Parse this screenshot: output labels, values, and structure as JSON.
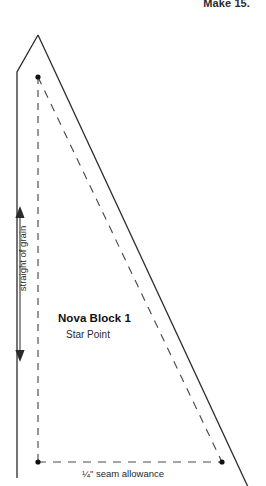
{
  "document": {
    "type": "quilting-pattern-template",
    "make_label": "Make 15.",
    "block_title": "Nova Block 1",
    "block_subtitle": "Star Point",
    "seam_allowance_label": "¼\" seam allowance",
    "grain_label": "straight of grain"
  },
  "colors": {
    "background": "#ffffff",
    "cut_line": "#2b2b2b",
    "stitch_line": "#555555",
    "dot": "#111111",
    "text": "#1a1a1a"
  },
  "geometry": {
    "cut_line": {
      "name": "cutting-line",
      "style": "solid",
      "points": [
        [
          38,
          35
        ],
        [
          17,
          72
        ],
        [
          17,
          478
        ],
        [
          247,
          486
        ]
      ],
      "note": "outer solid triangle outline, extends past bottom corners"
    },
    "stitch_line": {
      "name": "stitching-line",
      "style": "dashed",
      "points": [
        [
          38,
          77
        ],
        [
          38,
          462
        ],
        [
          222,
          462
        ],
        [
          38,
          77
        ]
      ],
      "note": "inner dashed seam line forming the finished triangle"
    },
    "corner_dots": [
      {
        "name": "apex-dot",
        "x": 38,
        "y": 77
      },
      {
        "name": "bottom-left-dot",
        "x": 38,
        "y": 462
      },
      {
        "name": "bottom-right-dot",
        "x": 222,
        "y": 462
      }
    ],
    "grain_arrow": {
      "x": 20,
      "y_top": 208,
      "y_bottom": 360,
      "double_headed": true
    }
  }
}
